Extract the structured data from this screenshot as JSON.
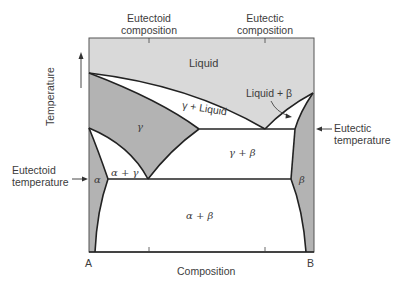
{
  "diagram": {
    "type": "binary eutectic phase diagram with eutectoid reaction",
    "x_axis_label": "Composition",
    "y_axis_label": "Temperature",
    "left_component": "A",
    "right_component": "B",
    "top_annotations": {
      "eutectoid": [
        "Eutectoid",
        "composition"
      ],
      "eutectic": [
        "Eutectic",
        "composition"
      ]
    },
    "side_annotations": {
      "eutectic_temperature": [
        "Eutectic",
        "temperature"
      ],
      "eutectoid_temperature": [
        "Eutectoid",
        "temperature"
      ]
    },
    "regions": {
      "liquid": "Liquid",
      "gamma": "γ",
      "gamma_liquid": "γ + Liquid",
      "liquid_beta": "Liquid + β",
      "gamma_beta": "γ + β",
      "alpha_gamma": "α + γ",
      "alpha": "α",
      "beta": "β",
      "alpha_beta": "α + β"
    },
    "colors": {
      "liquid_fill": "#d9d9d9",
      "single_phase_fill": "#b3b3b3",
      "two_phase_fill": "#ffffff",
      "line": "#222222"
    }
  }
}
